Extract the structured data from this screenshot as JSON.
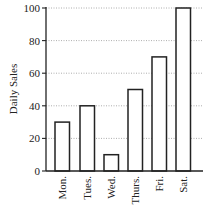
{
  "chart_data": {
    "type": "bar",
    "title": "",
    "xlabel": "",
    "ylabel": "Daily Sales",
    "categories": [
      "Mon.",
      "Tues.",
      "Wed.",
      "Thurs.",
      "Fri.",
      "Sat."
    ],
    "values": [
      30,
      40,
      10,
      50,
      70,
      100
    ],
    "ylim": [
      0,
      100
    ],
    "yticks": [
      0,
      20,
      40,
      60,
      80,
      100
    ],
    "grid": {
      "y": true,
      "style": "dotted"
    },
    "legend": null,
    "category_label_rotation": -90,
    "colors": {
      "bar_fill": "#ffffff",
      "bar_stroke": "#222222",
      "axis": "#222222",
      "grid": "#999999"
    }
  }
}
